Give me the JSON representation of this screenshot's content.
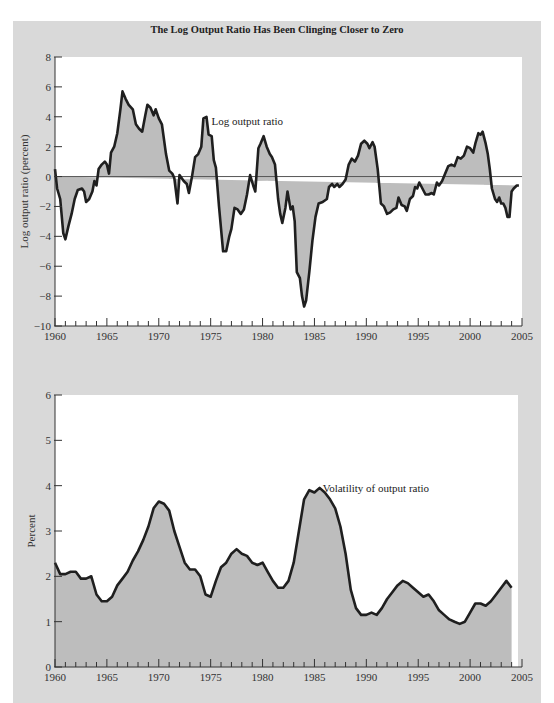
{
  "title": "The Log Output Ratio Has Been Clinging Closer to Zero",
  "colors": {
    "panel_bg": "#d9d9d9",
    "plot_bg": "#ffffff",
    "fill": "#bdbdbd",
    "line": "#1f1f1f",
    "zero_line": "#555555"
  },
  "chart_data": [
    {
      "type": "area",
      "title": "The Log Output Ratio Has Been Clinging Closer to Zero",
      "xlabel": "",
      "ylabel": "Log output ratio (percent)",
      "xlim": [
        1960,
        2005
      ],
      "ylim": [
        -10,
        8
      ],
      "xticks": [
        "1960",
        "1965",
        "1970",
        "1975",
        "1980",
        "1985",
        "1990",
        "1995",
        "2000",
        "2005"
      ],
      "yticks": [
        "8",
        "6",
        "4",
        "2",
        "0",
        "−2",
        "−4",
        "−6",
        "−8",
        "−10"
      ],
      "ytick_values": [
        8,
        6,
        4,
        2,
        0,
        -2,
        -4,
        -6,
        -8,
        -10
      ],
      "grid": false,
      "annotation": {
        "text": "Log output ratio",
        "x": 1974.8,
        "y": 3.7
      },
      "series": [
        {
          "name": "Log output ratio",
          "fill_to": 0,
          "x": [
            1960.0,
            1960.2,
            1960.5,
            1960.8,
            1961.0,
            1961.3,
            1961.6,
            1961.9,
            1962.2,
            1962.6,
            1962.8,
            1963.0,
            1963.3,
            1963.6,
            1963.8,
            1964.0,
            1964.2,
            1964.5,
            1964.8,
            1965.0,
            1965.2,
            1965.4,
            1965.7,
            1966.0,
            1966.3,
            1966.5,
            1966.8,
            1967.1,
            1967.5,
            1967.8,
            1968.1,
            1968.4,
            1968.7,
            1968.9,
            1969.2,
            1969.5,
            1969.7,
            1970.0,
            1970.3,
            1970.7,
            1971.0,
            1971.3,
            1971.5,
            1971.8,
            1972.0,
            1972.4,
            1972.7,
            1972.9,
            1973.2,
            1973.5,
            1973.8,
            1974.1,
            1974.3,
            1974.6,
            1974.8,
            1975.1,
            1975.3,
            1975.5,
            1975.8,
            1976.2,
            1976.5,
            1976.8,
            1977.0,
            1977.3,
            1977.6,
            1977.9,
            1978.2,
            1978.5,
            1978.8,
            1979.1,
            1979.3,
            1979.6,
            1979.8,
            1980.1,
            1980.4,
            1980.7,
            1980.9,
            1981.2,
            1981.5,
            1981.7,
            1981.9,
            1982.2,
            1982.4,
            1982.7,
            1982.9,
            1983.1,
            1983.3,
            1983.6,
            1983.8,
            1984.0,
            1984.2,
            1984.5,
            1984.8,
            1985.1,
            1985.4,
            1985.8,
            1986.2,
            1986.4,
            1986.7,
            1986.9,
            1987.2,
            1987.4,
            1987.7,
            1988.0,
            1988.3,
            1988.6,
            1988.9,
            1989.2,
            1989.5,
            1989.8,
            1990.1,
            1990.3,
            1990.6,
            1990.8,
            1991.1,
            1991.4,
            1991.7,
            1992.0,
            1992.3,
            1992.6,
            1992.9,
            1993.1,
            1993.4,
            1993.7,
            1993.9,
            1994.2,
            1994.5,
            1994.7,
            1994.9,
            1995.1,
            1995.4,
            1995.7,
            1996.0,
            1996.3,
            1996.5,
            1996.8,
            1997.0,
            1997.3,
            1997.6,
            1997.9,
            1998.2,
            1998.5,
            1998.8,
            1999.1,
            1999.4,
            1999.7,
            2000.0,
            2000.3,
            2000.5,
            2000.8,
            2001.0,
            2001.2,
            2001.5,
            2001.7,
            2001.9,
            2002.1,
            2002.4,
            2002.6,
            2002.8,
            2003.0,
            2003.2,
            2003.4,
            2003.6,
            2003.8,
            2004.0,
            2004.2,
            2004.5,
            2004.7,
            2004.9
          ],
          "values": [
            0.5,
            -0.8,
            -1.5,
            -3.8,
            -4.2,
            -3.3,
            -2.5,
            -1.5,
            -0.9,
            -0.8,
            -1.0,
            -1.7,
            -1.5,
            -1.0,
            -0.3,
            -0.6,
            0.5,
            0.8,
            1.0,
            0.8,
            0.2,
            1.6,
            2.0,
            2.9,
            4.5,
            5.7,
            5.2,
            4.8,
            4.5,
            3.5,
            3.2,
            3.0,
            4.1,
            4.8,
            4.6,
            4.1,
            4.5,
            3.9,
            3.5,
            1.5,
            0.4,
            0.2,
            -0.1,
            -1.8,
            0.1,
            -0.3,
            -0.5,
            -1.1,
            0.0,
            1.3,
            1.5,
            2.0,
            3.9,
            4.0,
            2.8,
            2.7,
            1.1,
            0.6,
            -2.0,
            -5.0,
            -5.0,
            -4.0,
            -3.5,
            -2.1,
            -2.2,
            -2.5,
            -2.2,
            -1.2,
            0.1,
            -0.6,
            -1.0,
            1.9,
            2.2,
            2.7,
            2.0,
            1.5,
            1.3,
            0.8,
            -1.5,
            -2.5,
            -3.1,
            -2.1,
            -1.0,
            -2.2,
            -2.0,
            -3.0,
            -6.4,
            -6.8,
            -8.0,
            -8.7,
            -8.3,
            -6.4,
            -4.3,
            -2.7,
            -1.8,
            -1.7,
            -1.5,
            -0.7,
            -0.5,
            -0.7,
            -0.5,
            -0.7,
            -0.5,
            -0.2,
            0.8,
            1.2,
            1.0,
            1.4,
            2.2,
            2.4,
            2.2,
            1.9,
            2.3,
            2.0,
            0.5,
            -1.8,
            -2.0,
            -2.5,
            -2.4,
            -2.2,
            -2.1,
            -1.4,
            -1.9,
            -2.0,
            -2.3,
            -1.5,
            -1.3,
            -0.7,
            -0.8,
            -0.4,
            -0.8,
            -1.2,
            -1.2,
            -1.1,
            -1.2,
            -0.4,
            -0.6,
            -0.3,
            0.2,
            0.7,
            0.8,
            0.7,
            1.3,
            1.2,
            1.4,
            2.0,
            1.9,
            1.6,
            2.2,
            2.9,
            2.8,
            3.0,
            2.2,
            1.5,
            0.5,
            -0.8,
            -1.5,
            -1.7,
            -1.4,
            -1.8,
            -1.8,
            -2.1,
            -2.7,
            -2.7,
            -1.0,
            -0.8,
            -0.6,
            -0.6
          ]
        }
      ]
    },
    {
      "type": "area",
      "title": "",
      "xlabel": "",
      "ylabel": "Percent",
      "xlim": [
        1960,
        2005
      ],
      "ylim": [
        0,
        6
      ],
      "xticks": [
        "1960",
        "1965",
        "1970",
        "1975",
        "1980",
        "1985",
        "1990",
        "1995",
        "2000",
        "2005"
      ],
      "yticks": [
        "6",
        "5",
        "4",
        "3",
        "2",
        "1",
        "0"
      ],
      "ytick_values": [
        6,
        5,
        4,
        3,
        2,
        1,
        0
      ],
      "grid": false,
      "annotation": {
        "text": "Volatility of output ratio",
        "x": 1985.5,
        "y": 3.95
      },
      "series": [
        {
          "name": "Volatility of output ratio",
          "fill_to": 0,
          "x": [
            1960.0,
            1960.5,
            1961.0,
            1961.5,
            1962.0,
            1962.5,
            1963.0,
            1963.5,
            1964.0,
            1964.5,
            1965.0,
            1965.5,
            1966.0,
            1966.5,
            1967.0,
            1967.5,
            1968.0,
            1968.5,
            1969.0,
            1969.5,
            1970.0,
            1970.5,
            1971.0,
            1971.5,
            1972.0,
            1972.5,
            1973.0,
            1973.5,
            1974.0,
            1974.5,
            1975.0,
            1975.5,
            1976.0,
            1976.5,
            1977.0,
            1977.5,
            1978.0,
            1978.5,
            1979.0,
            1979.5,
            1980.0,
            1980.5,
            1981.0,
            1981.5,
            1982.0,
            1982.5,
            1983.0,
            1983.5,
            1984.0,
            1984.5,
            1985.0,
            1985.5,
            1986.0,
            1986.5,
            1987.0,
            1987.5,
            1988.0,
            1988.5,
            1989.0,
            1989.5,
            1990.0,
            1990.5,
            1991.0,
            1991.5,
            1992.0,
            1992.5,
            1993.0,
            1993.5,
            1994.0,
            1994.5,
            1995.0,
            1995.5,
            1996.0,
            1996.5,
            1997.0,
            1997.5,
            1998.0,
            1998.5,
            1999.0,
            1999.5,
            2000.0,
            2000.5,
            2001.0,
            2001.5,
            2002.0,
            2002.5,
            2003.0,
            2003.5,
            2004.0
          ],
          "values": [
            2.3,
            2.05,
            2.05,
            2.1,
            2.1,
            1.95,
            1.95,
            2.0,
            1.6,
            1.45,
            1.45,
            1.55,
            1.8,
            1.95,
            2.1,
            2.35,
            2.55,
            2.8,
            3.1,
            3.5,
            3.65,
            3.6,
            3.45,
            3.0,
            2.65,
            2.3,
            2.15,
            2.15,
            2.0,
            1.6,
            1.55,
            1.9,
            2.2,
            2.3,
            2.5,
            2.6,
            2.5,
            2.45,
            2.3,
            2.25,
            2.3,
            2.1,
            1.9,
            1.75,
            1.75,
            1.9,
            2.3,
            3.0,
            3.7,
            3.9,
            3.85,
            3.95,
            3.85,
            3.7,
            3.5,
            3.1,
            2.5,
            1.7,
            1.3,
            1.15,
            1.15,
            1.2,
            1.15,
            1.3,
            1.5,
            1.65,
            1.8,
            1.9,
            1.85,
            1.75,
            1.65,
            1.55,
            1.6,
            1.45,
            1.25,
            1.15,
            1.05,
            1.0,
            0.95,
            1.0,
            1.2,
            1.4,
            1.4,
            1.35,
            1.45,
            1.6,
            1.75,
            1.9,
            1.75
          ]
        }
      ]
    }
  ]
}
